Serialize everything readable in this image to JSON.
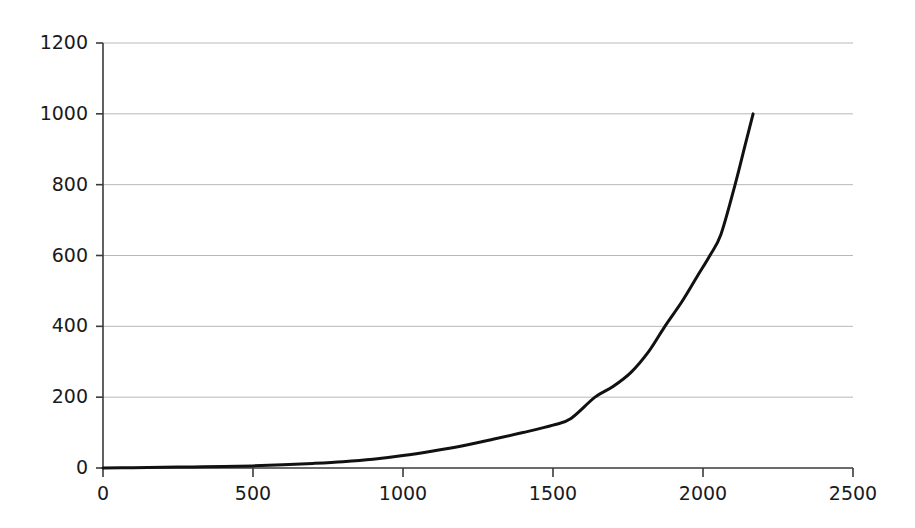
{
  "chart_data": {
    "type": "line",
    "title": "",
    "subtitle": "",
    "xlabel": "",
    "ylabel": "",
    "xlim": [
      0,
      2500
    ],
    "ylim": [
      0,
      1200
    ],
    "xticks": [
      0,
      500,
      1000,
      1500,
      2000,
      2500
    ],
    "yticks": [
      0,
      200,
      400,
      600,
      800,
      1000,
      1200
    ],
    "xtick_labels": [
      "0",
      "500",
      "1000",
      "1500",
      "2000",
      "2500"
    ],
    "ytick_labels": [
      "0",
      "200",
      "400",
      "600",
      "800",
      "1000",
      "1200"
    ],
    "grid": "horizontal",
    "grid_color": "#b8b8b8",
    "axis_color": "#3a3a3a",
    "legend": "none",
    "series": [
      {
        "name": "curve",
        "color": "#111111",
        "line_width": 3,
        "x": [
          0,
          100,
          200,
          300,
          400,
          500,
          600,
          700,
          800,
          900,
          1000,
          1100,
          1200,
          1300,
          1400,
          1500,
          1560,
          1640,
          1700,
          1760,
          1820,
          1873,
          1930,
          1980,
          2023,
          2060,
          2107,
          2140,
          2167
        ],
        "y": [
          0,
          1,
          2,
          3,
          4,
          6,
          9,
          13,
          18,
          25,
          35,
          48,
          63,
          81,
          100,
          121,
          140,
          200,
          230,
          270,
          330,
          400,
          470,
          540,
          600,
          660,
          800,
          910,
          1000
        ]
      }
    ]
  },
  "axes": {
    "y_axis_name": "value-axis",
    "x_axis_name": "index-axis"
  }
}
